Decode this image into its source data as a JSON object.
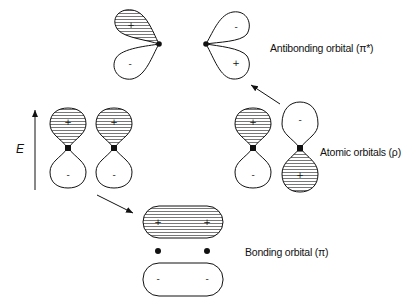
{
  "labels": {
    "antibonding": "Antibonding orbital (π*)",
    "atomic": "Atomic orbitals (ρ)",
    "bonding": "Bonding orbital (π)",
    "energy_axis": "E"
  },
  "signs": {
    "plus": "+",
    "minus": "-"
  },
  "colors": {
    "line": "#111111",
    "hatch": "#555555",
    "background": "#ffffff"
  }
}
